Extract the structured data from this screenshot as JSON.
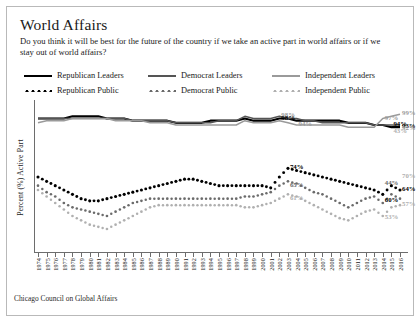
{
  "header": {
    "title": "World Affairs",
    "subtitle": "Do you think it will be best for the future of the country if we take an active part in world affairs or if we stay out of world affairs?"
  },
  "footer": {
    "source": "Chicago Council on Global Affairs"
  },
  "colors": {
    "republican_leaders": "#000000",
    "democrat_leaders": "#555555",
    "independent_leaders": "#9a9a9a",
    "republican_public": "#000000",
    "democrat_public": "#6b6b6b",
    "independent_public": "#b0b0b0",
    "axis": "#6d6d6d",
    "frame": "#b9b9b9"
  },
  "chart_data": {
    "type": "line",
    "title": "World Affairs",
    "xlabel": "",
    "ylabel": "Percent (%) Active Part",
    "ylim": [
      40,
      100
    ],
    "xlim": [
      1974,
      2016
    ],
    "grid": false,
    "legend_position": "top",
    "x": [
      1974,
      1975,
      1976,
      1977,
      1978,
      1979,
      1980,
      1981,
      1982,
      1983,
      1984,
      1985,
      1986,
      1987,
      1988,
      1989,
      1990,
      1991,
      1992,
      1993,
      1994,
      1995,
      1996,
      1997,
      1998,
      1999,
      2000,
      2001,
      2002,
      2003,
      2004,
      2005,
      2006,
      2007,
      2008,
      2009,
      2010,
      2011,
      2012,
      2013,
      2014,
      2015,
      2016
    ],
    "series": [
      {
        "name": "Republican Leaders",
        "style": "solid",
        "color": "#000000",
        "values": [
          97,
          97,
          97,
          97,
          98,
          98,
          98,
          98,
          97,
          97,
          97,
          96,
          96,
          96,
          96,
          96,
          95,
          95,
          95,
          95,
          96,
          96,
          96,
          96,
          97,
          96,
          96,
          96,
          97,
          97,
          96,
          96,
          96,
          96,
          96,
          96,
          95,
          95,
          95,
          94,
          94,
          93,
          93
        ],
        "end_label": "93%"
      },
      {
        "name": "Democrat Leaders",
        "style": "solid",
        "color": "#555555",
        "values": [
          97,
          97,
          97,
          97,
          97,
          97,
          97,
          97,
          97,
          97,
          97,
          96,
          96,
          96,
          96,
          96,
          95,
          95,
          95,
          95,
          95,
          96,
          96,
          96,
          98,
          97,
          97,
          97,
          98,
          97,
          97,
          96,
          96,
          95,
          95,
          95,
          95,
          95,
          95,
          94,
          94,
          94,
          94
        ],
        "end_label": "94%"
      },
      {
        "name": "Independent Leaders",
        "style": "solid",
        "color": "#9a9a9a",
        "values": [
          95,
          96,
          96,
          96,
          97,
          97,
          97,
          97,
          97,
          96,
          96,
          96,
          96,
          95,
          95,
          95,
          94,
          94,
          94,
          94,
          94,
          94,
          94,
          94,
          96,
          95,
          95,
          95,
          96,
          95,
          94,
          94,
          94,
          94,
          94,
          94,
          93,
          93,
          93,
          93,
          97,
          98,
          99
        ],
        "end_label": "99%"
      },
      {
        "name": "Republican Public",
        "style": "dotted",
        "color": "#000000",
        "values": [
          70,
          68,
          66,
          64,
          62,
          60,
          59,
          59,
          60,
          61,
          62,
          63,
          64,
          65,
          66,
          67,
          68,
          69,
          69,
          68,
          67,
          66,
          66,
          66,
          66,
          66,
          66,
          65,
          70,
          74,
          73,
          72,
          71,
          70,
          69,
          68,
          67,
          66,
          65,
          64,
          62,
          66,
          64
        ],
        "end_label": "64%"
      },
      {
        "name": "Democrat Public",
        "style": "dotted",
        "color": "#6b6b6b",
        "values": [
          66,
          63,
          61,
          58,
          56,
          55,
          54,
          53,
          52,
          54,
          56,
          58,
          59,
          60,
          60,
          60,
          60,
          60,
          60,
          60,
          60,
          60,
          60,
          60,
          61,
          61,
          62,
          63,
          66,
          68,
          67,
          65,
          63,
          62,
          60,
          58,
          56,
          58,
          60,
          61,
          58,
          62,
          60
        ],
        "end_label": "60%"
      },
      {
        "name": "Independent Public",
        "style": "dotted",
        "color": "#b0b0b0",
        "values": [
          64,
          61,
          58,
          55,
          52,
          50,
          48,
          47,
          46,
          48,
          50,
          52,
          54,
          56,
          57,
          57,
          57,
          57,
          57,
          57,
          57,
          57,
          57,
          57,
          56,
          56,
          57,
          58,
          60,
          62,
          61,
          59,
          57,
          55,
          53,
          51,
          50,
          52,
          54,
          55,
          52,
          56,
          57
        ],
        "end_label": "57%"
      }
    ],
    "annotations": [
      {
        "id": "ann-98-gray",
        "text": "98%",
        "x": 2002,
        "y": 98,
        "color": "#9a9a9a"
      },
      {
        "id": "ann-98-black",
        "text": "98%",
        "x": 2002,
        "y": 97,
        "color": "#000000"
      },
      {
        "id": "ann-94-gray",
        "text": "94%",
        "x": 2004,
        "y": 94,
        "color": "#9a9a9a"
      },
      {
        "id": "ann-97-end",
        "text": "97%",
        "x": 2014,
        "y": 97,
        "color": "#9a9a9a"
      },
      {
        "id": "ann-99-end",
        "text": "99%",
        "x": 2016,
        "y": 99,
        "color": "#9a9a9a"
      },
      {
        "id": "ann-93-end",
        "text": "93%",
        "x": 2016,
        "y": 93,
        "color": "#000000"
      },
      {
        "id": "ann-94-end",
        "text": "94%",
        "x": 2015,
        "y": 94,
        "color": "#000000"
      },
      {
        "id": "ann-92-end",
        "text": "92%",
        "x": 2016,
        "y": 92,
        "color": "#9a9a9a"
      },
      {
        "id": "ann-43-end",
        "text": "43%",
        "x": 2015,
        "y": 91,
        "color": "#b0b0b0"
      },
      {
        "id": "ann-74",
        "text": "74%",
        "x": 2003,
        "y": 74,
        "color": "#000000"
      },
      {
        "id": "ann-65",
        "text": "65%",
        "x": 2003,
        "y": 66,
        "color": "#6b6b6b"
      },
      {
        "id": "ann-61",
        "text": "61%",
        "x": 2003,
        "y": 60,
        "color": "#b0b0b0"
      },
      {
        "id": "ann-70-end",
        "text": "70%",
        "x": 2016,
        "y": 70,
        "color": "#b0b0b0"
      },
      {
        "id": "ann-64-end",
        "text": "64%",
        "x": 2016,
        "y": 64,
        "color": "#000000"
      },
      {
        "id": "ann-44",
        "text": "44%",
        "x": 2014,
        "y": 67,
        "color": "#6b6b6b"
      },
      {
        "id": "ann-60-end",
        "text": "60%",
        "x": 2014,
        "y": 59,
        "color": "#000000"
      },
      {
        "id": "ann-57-end",
        "text": "57%",
        "x": 2016,
        "y": 57,
        "color": "#b0b0b0"
      },
      {
        "id": "ann-53-end",
        "text": "53%",
        "x": 2014,
        "y": 51,
        "color": "#b0b0b0"
      }
    ]
  },
  "legend": {
    "items": [
      {
        "label": "Republican Leaders",
        "style": "solid",
        "color": "#000000"
      },
      {
        "label": "Democrat Leaders",
        "style": "solid",
        "color": "#555555"
      },
      {
        "label": "Independent Leaders",
        "style": "solid",
        "color": "#9a9a9a"
      },
      {
        "label": "Republican Public",
        "style": "dotted",
        "color": "#000000"
      },
      {
        "label": "Democrat Public",
        "style": "dotted",
        "color": "#6b6b6b"
      },
      {
        "label": "Independent Public",
        "style": "dotted",
        "color": "#b0b0b0"
      }
    ]
  }
}
